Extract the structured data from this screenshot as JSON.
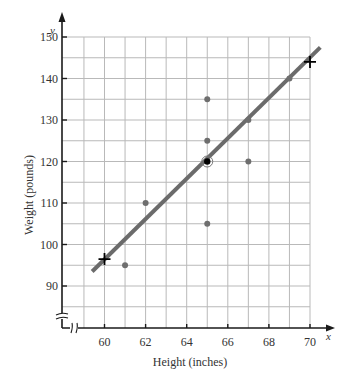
{
  "chart_data": {
    "type": "scatter",
    "title": "",
    "xlabel": "Height (inches)",
    "ylabel": "Weight (pounds)",
    "x_axis_var": "x",
    "y_axis_var": "y",
    "xlim": [
      58,
      70
    ],
    "ylim": [
      80,
      150
    ],
    "x_ticks": [
      60,
      62,
      64,
      66,
      68,
      70
    ],
    "y_ticks": [
      90,
      100,
      110,
      120,
      130,
      140,
      150
    ],
    "grid": true,
    "grid_x_step": 1,
    "grid_y_step": 5,
    "axis_breaks": true,
    "series": [
      {
        "name": "data points",
        "points": [
          {
            "x": 61,
            "y": 95
          },
          {
            "x": 62,
            "y": 110
          },
          {
            "x": 65,
            "y": 105
          },
          {
            "x": 65,
            "y": 125
          },
          {
            "x": 65,
            "y": 135
          },
          {
            "x": 67,
            "y": 120
          },
          {
            "x": 67,
            "y": 130
          },
          {
            "x": 69,
            "y": 140
          }
        ]
      }
    ],
    "mean_point": {
      "x": 65,
      "y": 120,
      "marker": "circled"
    },
    "regression_line": {
      "x_start": 59.4,
      "y_start": 93.5,
      "x_end": 70.5,
      "y_end": 147.5
    },
    "line_markers": [
      {
        "x": 60,
        "y": 96.5,
        "marker": "cross"
      },
      {
        "x": 70,
        "y": 144,
        "marker": "cross"
      }
    ]
  },
  "colors": {
    "grid": "#b9b9b9",
    "axis": "#1a1a1a",
    "line": "#6b6b6b",
    "point": "#6e6e6e",
    "mean": "#000000",
    "cross": "#000000"
  }
}
